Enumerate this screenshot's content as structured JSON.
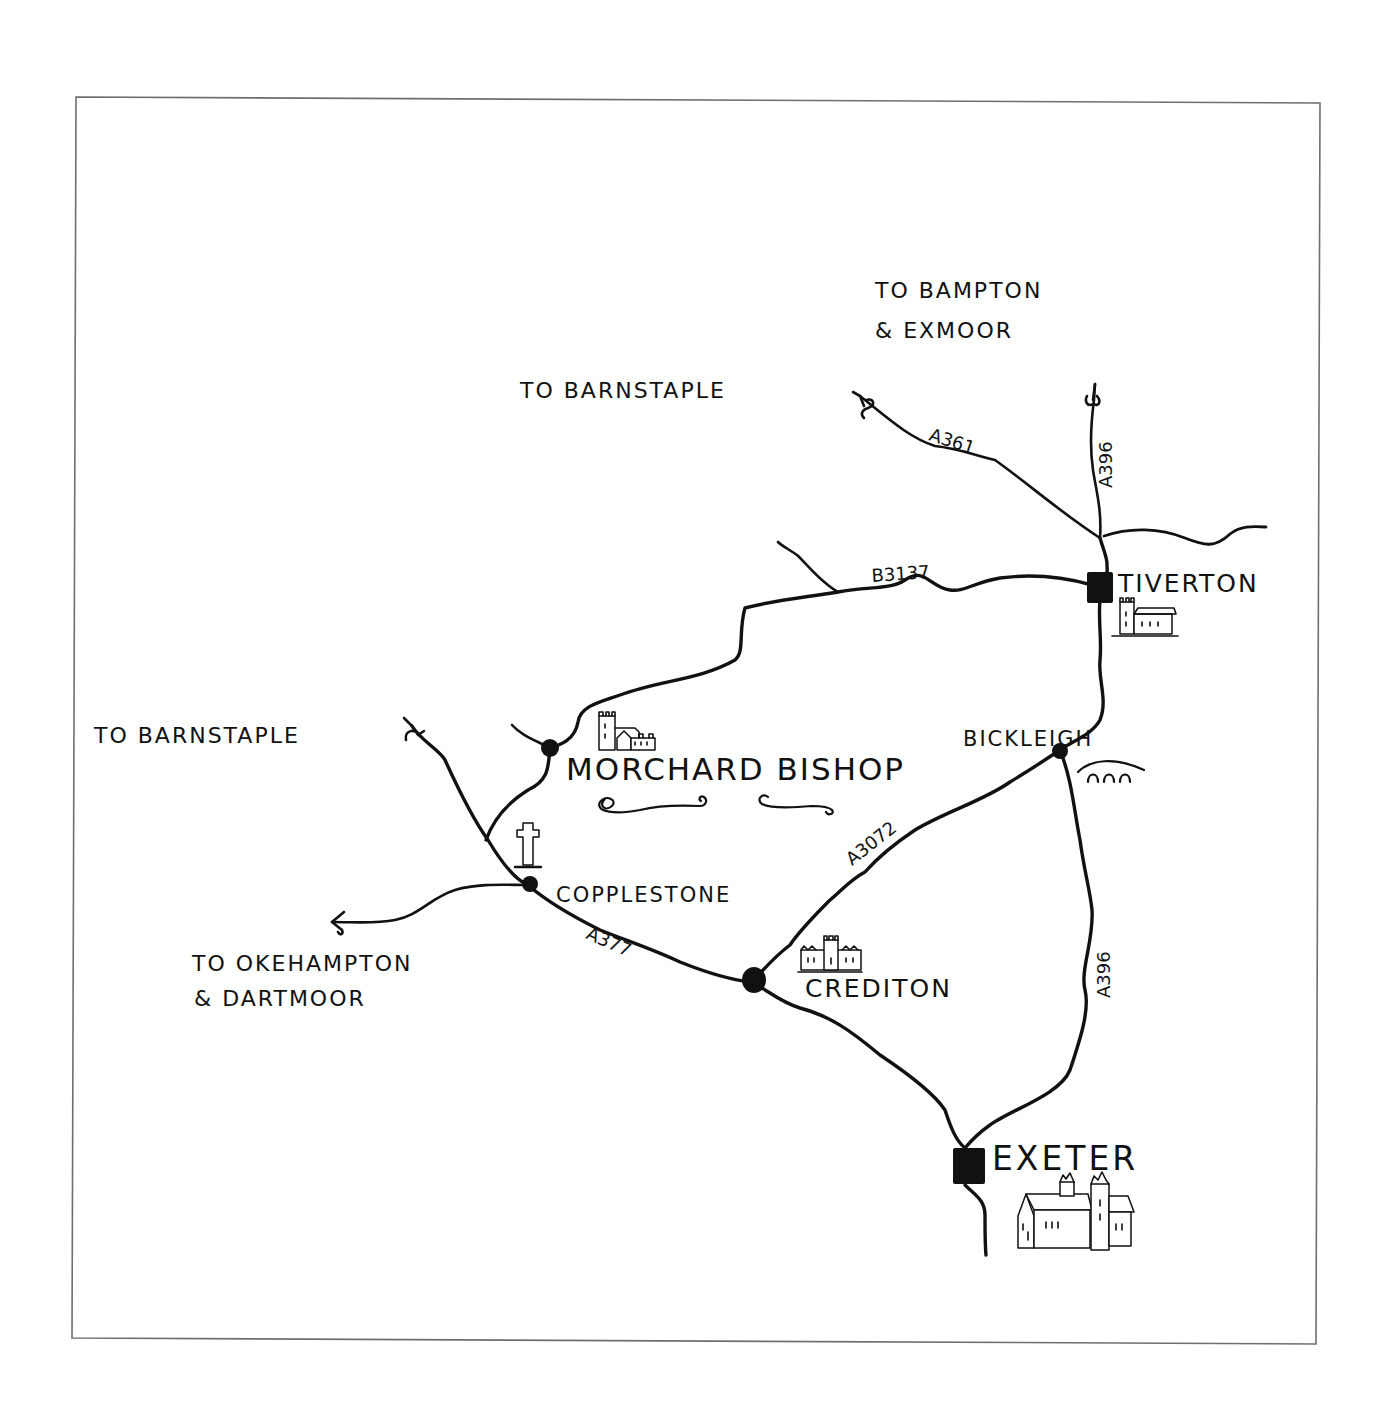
{
  "map": {
    "style": "hand-drawn ink sketch map",
    "colors": {
      "ink": "#111111",
      "frame": "#6e6e6e",
      "background": "#ffffff"
    },
    "destinations": [
      {
        "id": "bampton",
        "line1": "TO BAMPTON",
        "line2": "& EXMOOR"
      },
      {
        "id": "barnstaple-north",
        "line1": "TO BARNSTAPLE"
      },
      {
        "id": "barnstaple-west",
        "line1": "TO BARNSTAPLE"
      },
      {
        "id": "okehampton",
        "line1": "TO OKEHAMPTON",
        "line2": "& DARTMOOR"
      }
    ],
    "places": [
      {
        "id": "tiverton",
        "name": "TIVERTON",
        "marker": "square",
        "icon": "church-icon"
      },
      {
        "id": "bickleigh",
        "name": "BICKLEIGH",
        "marker": "dot",
        "icon": "bridge-icon"
      },
      {
        "id": "morchard-bishop",
        "name": "MORCHARD BISHOP",
        "marker": "dot",
        "icon": "church-icon"
      },
      {
        "id": "copplestone",
        "name": "COPPLESTONE",
        "marker": "dot",
        "icon": "cross-icon"
      },
      {
        "id": "crediton",
        "name": "CREDITON",
        "marker": "dot",
        "icon": "church-icon"
      },
      {
        "id": "exeter",
        "name": "EXETER",
        "marker": "square",
        "icon": "cathedral-icon"
      }
    ],
    "roads": [
      {
        "id": "a361",
        "label": "A361"
      },
      {
        "id": "a396-north",
        "label": "A396"
      },
      {
        "id": "b3137",
        "label": "B3137"
      },
      {
        "id": "a3072",
        "label": "A3072"
      },
      {
        "id": "a396-south",
        "label": "A396"
      },
      {
        "id": "a377",
        "label": "A377"
      }
    ]
  }
}
